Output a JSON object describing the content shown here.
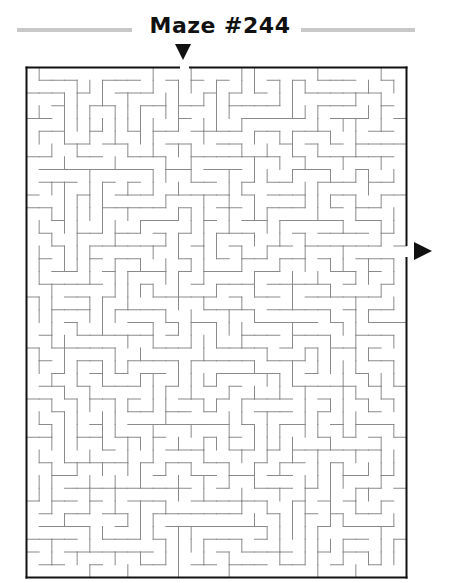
{
  "puzzle": {
    "title": "Maze #244",
    "grid": {
      "cols": 30,
      "rows": 40
    },
    "entry": {
      "side": "top",
      "label": "start-arrow"
    },
    "exit": {
      "side": "right",
      "label": "finish-arrow"
    }
  },
  "colors": {
    "border": "#111111",
    "walls": "#8a8a8a",
    "title_rule": "#c8c8c8",
    "arrow": "#111111"
  }
}
